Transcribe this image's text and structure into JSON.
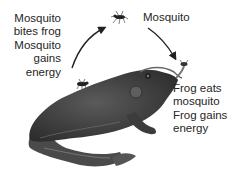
{
  "diagram": {
    "type": "cycle",
    "labels": {
      "left": [
        "Mosquito",
        "bites frog",
        "Mosquito",
        "gains",
        "energy"
      ],
      "top": "Mosquito",
      "right": [
        "Frog eats",
        "mosquito",
        "Frog gains",
        "energy"
      ]
    },
    "nodes": [
      {
        "id": "mosquito-flying",
        "label": "Mosquito"
      },
      {
        "id": "frog",
        "label": "Frog"
      },
      {
        "id": "mosquito-on-frog",
        "label": "Mosquito on frog"
      }
    ],
    "edges": [
      {
        "from": "mosquito-on-frog",
        "to": "mosquito-flying",
        "label": "Mosquito bites frog / Mosquito gains energy"
      },
      {
        "from": "mosquito-flying",
        "to": "frog",
        "label": "Frog eats mosquito / Frog gains energy"
      }
    ],
    "colors": {
      "text": "#262626",
      "arrow": "#222222",
      "frog_dark": "#3a3a3a",
      "frog_light": "#8a8a8a"
    }
  }
}
